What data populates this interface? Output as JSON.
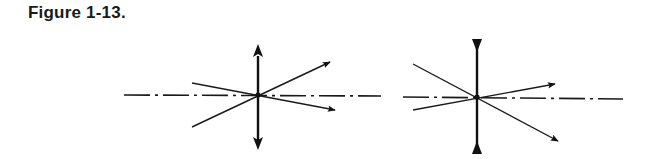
{
  "figure": {
    "title": "Figure 1-13.",
    "colors": {
      "ink": "#1a1a1a",
      "background": "#ffffff"
    }
  },
  "panels": [
    {
      "name": "converging-lens",
      "lens_type": "convex (outward arrowheads)",
      "optical_axis": "dash-dot horizontal line",
      "rays": 2,
      "description": "Two rays pass undeviated through the optical center of a converging lens"
    },
    {
      "name": "diverging-lens",
      "lens_type": "concave (inward arrowheads)",
      "optical_axis": "dash-dot horizontal line",
      "rays": 2,
      "description": "Two rays pass undeviated through the optical center of a diverging lens"
    }
  ]
}
